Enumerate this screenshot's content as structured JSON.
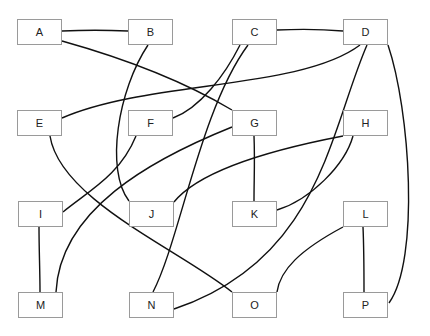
{
  "diagram": {
    "type": "graph",
    "nodes": [
      {
        "id": "A",
        "label": "A",
        "x": 17,
        "y": 19
      },
      {
        "id": "B",
        "label": "B",
        "x": 128,
        "y": 19
      },
      {
        "id": "C",
        "label": "C",
        "x": 232,
        "y": 19
      },
      {
        "id": "D",
        "label": "D",
        "x": 343,
        "y": 19
      },
      {
        "id": "E",
        "label": "E",
        "x": 17,
        "y": 110
      },
      {
        "id": "F",
        "label": "F",
        "x": 128,
        "y": 110
      },
      {
        "id": "G",
        "label": "G",
        "x": 232,
        "y": 110
      },
      {
        "id": "H",
        "label": "H",
        "x": 343,
        "y": 110
      },
      {
        "id": "I",
        "label": "I",
        "x": 18,
        "y": 201
      },
      {
        "id": "J",
        "label": "J",
        "x": 129,
        "y": 201
      },
      {
        "id": "K",
        "label": "K",
        "x": 232,
        "y": 201
      },
      {
        "id": "L",
        "label": "L",
        "x": 343,
        "y": 201
      },
      {
        "id": "M",
        "label": "M",
        "x": 18,
        "y": 292
      },
      {
        "id": "N",
        "label": "N",
        "x": 129,
        "y": 292
      },
      {
        "id": "O",
        "label": "O",
        "x": 232,
        "y": 292
      },
      {
        "id": "P",
        "label": "P",
        "x": 343,
        "y": 292
      }
    ],
    "edges": [
      {
        "from": "A",
        "to": "B",
        "d": "M62,31 C85,30 105,30 128,31"
      },
      {
        "from": "A",
        "to": "G",
        "d": "M62,41 C130,60 190,85 232,110"
      },
      {
        "from": "B",
        "to": "J",
        "d": "M148,45 C118,90 105,170 129,201"
      },
      {
        "from": "C",
        "to": "D",
        "d": "M277,30 C300,29 320,29 343,31"
      },
      {
        "from": "C",
        "to": "F",
        "d": "M240,45 C225,75 200,108 173,118"
      },
      {
        "from": "C",
        "to": "N",
        "d": "M248,45 C200,110 180,240 153,292"
      },
      {
        "from": "D",
        "to": "E",
        "d": "M360,45 C300,90 150,80 62,118"
      },
      {
        "from": "D",
        "to": "N",
        "d": "M367,45 C330,130 320,260 174,309"
      },
      {
        "from": "D",
        "to": "P",
        "d": "M388,45 C410,110 420,260 389,303"
      },
      {
        "from": "E",
        "to": "O",
        "d": "M50,136 C60,200 180,250 232,292"
      },
      {
        "from": "F",
        "to": "I",
        "d": "M136,136 C120,175 90,190 63,212"
      },
      {
        "from": "G",
        "to": "K",
        "d": "M254,136 C255,160 254,180 254,201"
      },
      {
        "from": "G",
        "to": "M",
        "d": "M232,127 C150,160 60,210 56,292"
      },
      {
        "from": "H",
        "to": "J",
        "d": "M343,136 C270,150 200,170 174,202"
      },
      {
        "from": "H",
        "to": "K",
        "d": "M353,136 C345,165 310,200 277,210"
      },
      {
        "from": "I",
        "to": "M",
        "d": "M39,227 C39,250 40,270 40,292"
      },
      {
        "from": "L",
        "to": "O",
        "d": "M343,227 C300,250 280,270 277,292"
      },
      {
        "from": "L",
        "to": "P",
        "d": "M363,227 C364,250 364,270 364,292"
      }
    ]
  }
}
